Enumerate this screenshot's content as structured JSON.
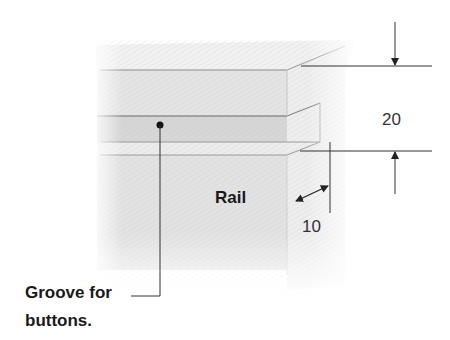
{
  "diagram": {
    "labels": {
      "rail": "Rail",
      "groove_line1": "Groove for",
      "groove_line2": "buttons.",
      "height_dimension": "20",
      "depth_dimension": "10"
    },
    "dimensions": {
      "groove_height": 20,
      "groove_depth": 10
    },
    "colors": {
      "background": "#ffffff",
      "wood_light": "#eeeeee",
      "wood_mid": "#dddddd",
      "wood_groove": "#d2d2d2",
      "line": "#333333",
      "text": "#1a1a1a"
    }
  }
}
